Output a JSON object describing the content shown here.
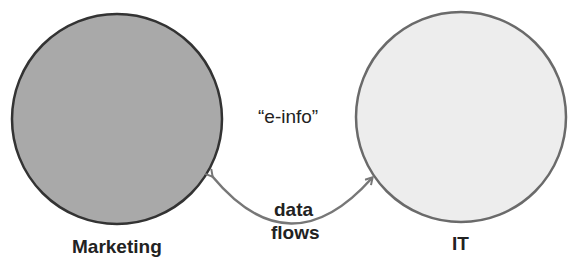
{
  "diagram": {
    "nodes": [
      {
        "id": "marketing",
        "label": "Marketing",
        "fill": "#a9a9a9",
        "stroke": "#333333"
      },
      {
        "id": "it",
        "label": "IT",
        "fill": "#ededed",
        "stroke": "#6a6a6a"
      }
    ],
    "center_label": "“e-info”",
    "edge": {
      "from": "it",
      "to": "marketing",
      "bidirectional": true,
      "label_line1": "data",
      "label_line2": "flows",
      "color": "#777777"
    }
  }
}
